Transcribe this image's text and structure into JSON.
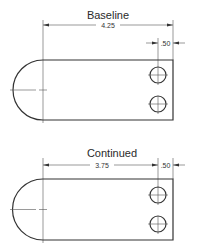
{
  "drawings": [
    {
      "title": "Baseline",
      "dimensions": [
        {
          "label": "4.25",
          "from": "left-center",
          "to": "right-edge"
        },
        {
          "label": ".50",
          "from": "hole-center",
          "to": "right-edge"
        }
      ]
    },
    {
      "title": "Continued",
      "dimensions": [
        {
          "label": "3.75",
          "from": "left-center",
          "to": "hole-center"
        },
        {
          "label": ".50",
          "from": "hole-center",
          "to": "right-edge"
        }
      ]
    }
  ],
  "colors": {
    "line": "#333333",
    "background": "#ffffff"
  }
}
